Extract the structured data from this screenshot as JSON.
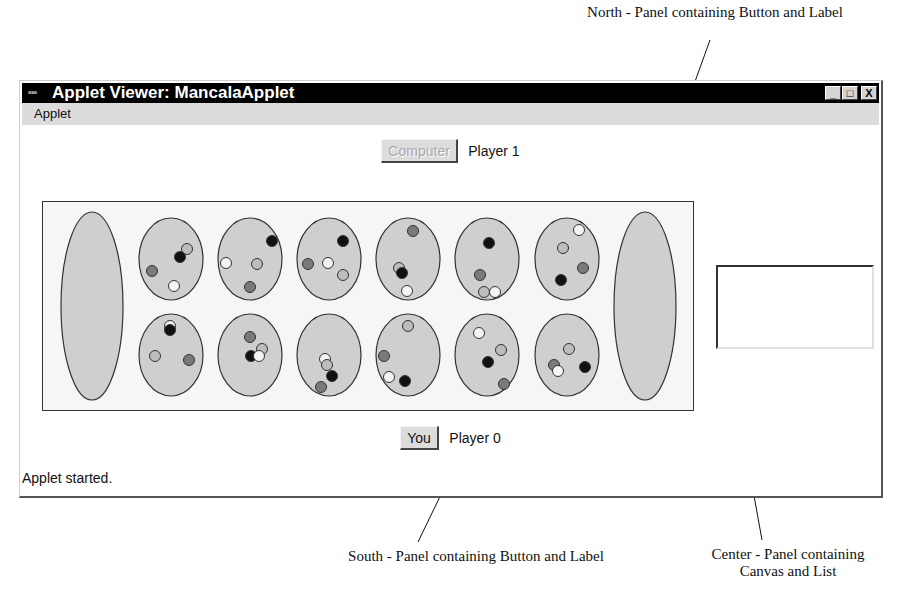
{
  "annotations": {
    "north": "North - Panel containing Button and Label",
    "south": "South - Panel containing Button and Label",
    "center": "Center - Panel containing Canvas and List"
  },
  "window": {
    "title": "Applet Viewer: MancalaApplet",
    "controls": {
      "minimize": "_",
      "maximize": "□",
      "close": "X"
    }
  },
  "menubar": {
    "items": [
      {
        "label": "Applet"
      }
    ]
  },
  "north_panel": {
    "button_label": "Computer",
    "button_enabled": false,
    "label": "Player 1"
  },
  "south_panel": {
    "button_label": "You",
    "button_enabled": true,
    "label": "Player 0"
  },
  "status": "Applet started.",
  "list": {
    "items": []
  },
  "colors": {
    "titlebar": "#000000",
    "pit_fill": "#cfcfcf",
    "stone_white": "#f4f4f4",
    "stone_light": "#bdbdbd",
    "stone_gray": "#7a7a7a",
    "stone_black": "#111111"
  },
  "board": {
    "stores": [
      {
        "name": "store-left",
        "stones": []
      },
      {
        "name": "store-right",
        "stones": []
      }
    ],
    "top_row": [
      {
        "stones": [
          [
            "light",
            16,
            -10
          ],
          [
            "black",
            9,
            -2
          ],
          [
            "gray",
            -19,
            12
          ],
          [
            "white",
            3,
            27
          ]
        ]
      },
      {
        "stones": [
          [
            "black",
            22,
            -18
          ],
          [
            "white",
            -24,
            4
          ],
          [
            "light",
            7,
            5
          ],
          [
            "gray",
            0,
            28
          ]
        ]
      },
      {
        "stones": [
          [
            "black",
            14,
            -18
          ],
          [
            "gray",
            -21,
            5
          ],
          [
            "white",
            -1,
            4
          ],
          [
            "light",
            14,
            16
          ]
        ]
      },
      {
        "stones": [
          [
            "gray",
            5,
            -28
          ],
          [
            "light",
            -9,
            9
          ],
          [
            "black",
            -6,
            14
          ],
          [
            "white",
            -1,
            32
          ]
        ]
      },
      {
        "stones": [
          [
            "black",
            2,
            -16
          ],
          [
            "gray",
            -7,
            16
          ],
          [
            "light",
            -3,
            33
          ],
          [
            "white",
            8,
            33
          ]
        ]
      },
      {
        "stones": [
          [
            "white",
            12,
            -29
          ],
          [
            "light",
            -4,
            -11
          ],
          [
            "gray",
            16,
            9
          ],
          [
            "black",
            -6,
            21
          ]
        ]
      }
    ],
    "bottom_row": [
      {
        "stones": [
          [
            "white",
            -1,
            -29
          ],
          [
            "black",
            -1,
            -25
          ],
          [
            "light",
            -16,
            1
          ],
          [
            "gray",
            18,
            5
          ]
        ]
      },
      {
        "stones": [
          [
            "gray",
            0,
            -18
          ],
          [
            "light",
            12,
            -6
          ],
          [
            "black",
            1,
            1
          ],
          [
            "white",
            9,
            1
          ]
        ]
      },
      {
        "stones": [
          [
            "white",
            -4,
            4
          ],
          [
            "light",
            -2,
            10
          ],
          [
            "black",
            3,
            21
          ],
          [
            "gray",
            -8,
            32
          ]
        ]
      },
      {
        "stones": [
          [
            "light",
            0,
            -29
          ],
          [
            "gray",
            -24,
            1
          ],
          [
            "white",
            -19,
            22
          ],
          [
            "black",
            -3,
            26
          ]
        ]
      },
      {
        "stones": [
          [
            "white",
            -8,
            -22
          ],
          [
            "light",
            14,
            -5
          ],
          [
            "black",
            1,
            7
          ],
          [
            "gray",
            17,
            29
          ]
        ]
      },
      {
        "stones": [
          [
            "light",
            2,
            -6
          ],
          [
            "gray",
            -13,
            10
          ],
          [
            "white",
            -9,
            16
          ],
          [
            "black",
            18,
            12
          ]
        ]
      }
    ]
  }
}
